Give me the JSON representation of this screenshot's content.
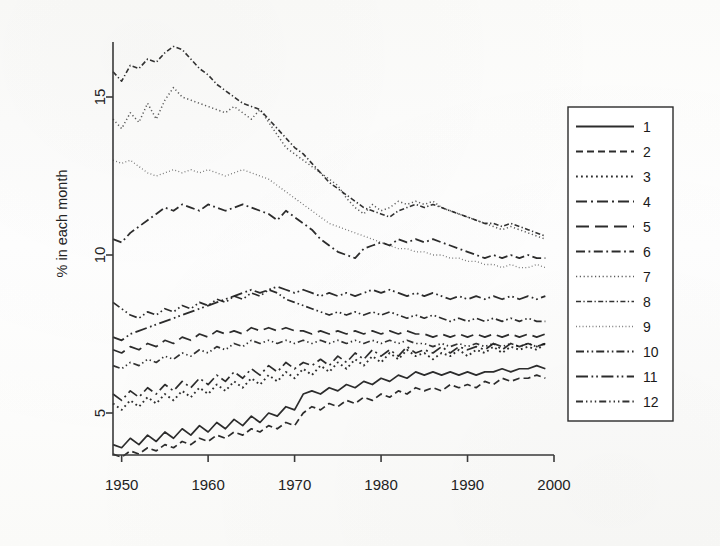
{
  "figure": {
    "title": "",
    "background_color": "#fefefd",
    "ink_color": "#1c1c1c"
  },
  "axes": {
    "ylabel": "% in each month",
    "xlabel": "",
    "y_ticks": [
      "5",
      "10",
      "15"
    ],
    "x_ticks": [
      "1950",
      "1960",
      "1970",
      "1980",
      "1990",
      "2000"
    ]
  },
  "legend": {
    "position": "right",
    "entries": [
      {
        "label": "1",
        "style": "solid"
      },
      {
        "label": "2",
        "style": "dashed"
      },
      {
        "label": "3",
        "style": "dotted"
      },
      {
        "label": "4",
        "style": "long-dash-dot"
      },
      {
        "label": "5",
        "style": "long-dash"
      },
      {
        "label": "6",
        "style": "dash-dot"
      },
      {
        "label": "7",
        "style": "fine-dotted-light"
      },
      {
        "label": "8",
        "style": "fine-dash-dot"
      },
      {
        "label": "9",
        "style": "very-fine-dotted"
      },
      {
        "label": "10",
        "style": "dash-dot-dot"
      },
      {
        "label": "11",
        "style": "long-dash-dot-dot"
      },
      {
        "label": "12",
        "style": "dash-dot-dot-dot"
      }
    ]
  },
  "chart_data": {
    "type": "line",
    "title": "",
    "xlabel": "",
    "ylabel": "% in each month",
    "xlim": [
      1949,
      2000
    ],
    "ylim": [
      3.2,
      17.0
    ],
    "grid": false,
    "legend_position": "right",
    "x": [
      1949,
      1950,
      1951,
      1952,
      1953,
      1954,
      1955,
      1956,
      1957,
      1958,
      1959,
      1960,
      1961,
      1962,
      1963,
      1964,
      1965,
      1966,
      1967,
      1968,
      1969,
      1970,
      1971,
      1972,
      1973,
      1974,
      1975,
      1976,
      1977,
      1978,
      1979,
      1980,
      1981,
      1982,
      1983,
      1984,
      1985,
      1986,
      1987,
      1988,
      1989,
      1990,
      1991,
      1992,
      1993,
      1994,
      1995,
      1996,
      1997,
      1998,
      1999
    ],
    "series": [
      {
        "name": "1",
        "style": "solid",
        "values": [
          4.0,
          3.9,
          4.2,
          4.0,
          4.3,
          4.1,
          4.4,
          4.2,
          4.5,
          4.3,
          4.6,
          4.4,
          4.7,
          4.5,
          4.8,
          4.6,
          4.9,
          4.7,
          5.0,
          4.9,
          5.2,
          5.1,
          5.6,
          5.7,
          5.6,
          5.8,
          5.7,
          5.9,
          5.8,
          6.0,
          5.9,
          6.1,
          6.0,
          6.2,
          6.1,
          6.3,
          6.2,
          6.3,
          6.2,
          6.3,
          6.2,
          6.3,
          6.2,
          6.3,
          6.3,
          6.4,
          6.3,
          6.4,
          6.4,
          6.5,
          6.4
        ]
      },
      {
        "name": "2",
        "style": "dashed",
        "values": [
          3.7,
          3.6,
          3.8,
          3.7,
          3.9,
          3.8,
          4.0,
          3.9,
          4.1,
          4.0,
          4.2,
          4.1,
          4.3,
          4.2,
          4.4,
          4.3,
          4.5,
          4.4,
          4.6,
          4.5,
          4.7,
          4.6,
          5.0,
          5.2,
          5.1,
          5.3,
          5.2,
          5.4,
          5.3,
          5.5,
          5.4,
          5.6,
          5.5,
          5.7,
          5.6,
          5.8,
          5.7,
          5.8,
          5.7,
          5.9,
          5.8,
          5.9,
          5.8,
          6.0,
          5.9,
          6.1,
          6.0,
          6.1,
          6.1,
          6.2,
          6.1
        ]
      },
      {
        "name": "3",
        "style": "dotted",
        "values": [
          5.3,
          5.1,
          5.4,
          5.2,
          5.5,
          5.3,
          5.6,
          5.4,
          5.7,
          5.5,
          5.8,
          5.6,
          5.9,
          5.7,
          6.0,
          5.8,
          6.1,
          5.9,
          6.2,
          6.0,
          6.3,
          6.1,
          6.4,
          6.2,
          6.5,
          6.3,
          6.6,
          6.4,
          6.7,
          6.5,
          6.8,
          6.6,
          6.9,
          6.7,
          7.0,
          6.8,
          6.9,
          6.7,
          6.9,
          6.8,
          7.0,
          6.8,
          7.0,
          6.9,
          7.1,
          6.9,
          7.1,
          7.0,
          7.1,
          7.0,
          7.2
        ]
      },
      {
        "name": "4",
        "style": "long-dash-dot",
        "values": [
          5.6,
          5.4,
          5.7,
          5.5,
          5.8,
          5.6,
          5.9,
          5.7,
          6.0,
          5.8,
          6.1,
          5.9,
          6.2,
          6.0,
          6.3,
          6.1,
          6.4,
          6.2,
          6.5,
          6.3,
          6.6,
          6.4,
          6.6,
          6.5,
          6.7,
          6.5,
          6.8,
          6.6,
          6.9,
          6.7,
          7.0,
          6.8,
          7.0,
          6.8,
          7.1,
          6.9,
          7.0,
          6.9,
          7.1,
          6.9,
          7.1,
          7.0,
          7.1,
          7.0,
          7.2,
          7.0,
          7.2,
          7.1,
          7.2,
          7.1,
          7.2
        ]
      },
      {
        "name": "5",
        "style": "long-dash",
        "values": [
          7.0,
          6.9,
          7.1,
          7.0,
          7.2,
          7.1,
          7.3,
          7.2,
          7.4,
          7.3,
          7.5,
          7.4,
          7.6,
          7.5,
          7.6,
          7.5,
          7.7,
          7.6,
          7.7,
          7.6,
          7.7,
          7.6,
          7.6,
          7.5,
          7.6,
          7.5,
          7.6,
          7.5,
          7.6,
          7.5,
          7.6,
          7.5,
          7.6,
          7.5,
          7.6,
          7.5,
          7.5,
          7.4,
          7.5,
          7.4,
          7.5,
          7.4,
          7.5,
          7.4,
          7.5,
          7.4,
          7.5,
          7.4,
          7.5,
          7.4,
          7.5
        ]
      },
      {
        "name": "6",
        "style": "dash-dot",
        "values": [
          10.5,
          10.4,
          10.7,
          10.9,
          11.1,
          11.3,
          11.5,
          11.4,
          11.6,
          11.5,
          11.4,
          11.6,
          11.5,
          11.4,
          11.5,
          11.6,
          11.5,
          11.4,
          11.3,
          11.1,
          11.4,
          11.2,
          11.0,
          10.8,
          10.5,
          10.3,
          10.1,
          10.0,
          9.9,
          10.2,
          10.3,
          10.4,
          10.3,
          10.5,
          10.4,
          10.5,
          10.4,
          10.5,
          10.4,
          10.3,
          10.2,
          10.1,
          10.0,
          9.9,
          10.0,
          9.9,
          10.0,
          9.9,
          10.0,
          9.9,
          9.9
        ]
      },
      {
        "name": "7",
        "style": "fine-dotted-light",
        "values": [
          14.3,
          14.0,
          14.5,
          14.2,
          14.8,
          14.3,
          14.9,
          15.3,
          15.0,
          14.9,
          14.8,
          14.7,
          14.6,
          14.5,
          14.7,
          14.5,
          14.3,
          14.6,
          14.2,
          13.8,
          13.4,
          13.2,
          13.0,
          12.8,
          12.6,
          12.4,
          12.2,
          11.8,
          11.5,
          11.3,
          11.6,
          11.4,
          11.5,
          11.7,
          11.6,
          11.7,
          11.6,
          11.7,
          11.5,
          11.4,
          11.3,
          11.2,
          11.1,
          11.0,
          10.9,
          10.8,
          10.9,
          10.8,
          10.7,
          10.6,
          10.5
        ]
      },
      {
        "name": "8",
        "style": "fine-dash-dot",
        "values": [
          15.8,
          15.5,
          16.0,
          15.9,
          16.2,
          16.1,
          16.4,
          16.6,
          16.5,
          16.2,
          15.9,
          15.7,
          15.4,
          15.2,
          15.0,
          14.8,
          14.7,
          14.6,
          14.3,
          14.0,
          13.7,
          13.4,
          13.2,
          12.9,
          12.6,
          12.3,
          12.1,
          11.9,
          11.7,
          11.5,
          11.4,
          11.3,
          11.2,
          11.4,
          11.5,
          11.6,
          11.5,
          11.6,
          11.5,
          11.4,
          11.3,
          11.2,
          11.1,
          11.0,
          11.0,
          10.9,
          11.0,
          10.9,
          10.8,
          10.7,
          10.6
        ]
      },
      {
        "name": "9",
        "style": "very-fine-dotted",
        "values": [
          13.0,
          12.9,
          13.0,
          12.8,
          12.6,
          12.5,
          12.6,
          12.7,
          12.6,
          12.7,
          12.6,
          12.7,
          12.6,
          12.5,
          12.6,
          12.7,
          12.6,
          12.5,
          12.4,
          12.2,
          12.0,
          11.8,
          11.6,
          11.4,
          11.2,
          11.0,
          10.9,
          10.8,
          10.7,
          10.6,
          10.5,
          10.4,
          10.3,
          10.2,
          10.2,
          10.1,
          10.1,
          10.0,
          10.0,
          9.9,
          9.9,
          9.8,
          9.8,
          9.7,
          9.7,
          9.6,
          9.7,
          9.6,
          9.6,
          9.7,
          9.6
        ]
      },
      {
        "name": "10",
        "style": "dash-dot-dot",
        "values": [
          8.5,
          8.3,
          8.1,
          8.0,
          8.2,
          8.1,
          8.3,
          8.2,
          8.4,
          8.3,
          8.5,
          8.4,
          8.6,
          8.5,
          8.7,
          8.6,
          8.8,
          8.7,
          8.9,
          8.8,
          8.6,
          8.5,
          8.4,
          8.3,
          8.2,
          8.1,
          8.2,
          8.1,
          8.2,
          8.1,
          8.2,
          8.1,
          8.2,
          8.1,
          8.0,
          8.1,
          8.0,
          8.1,
          8.0,
          7.9,
          8.0,
          7.9,
          8.0,
          7.9,
          8.0,
          7.9,
          8.0,
          7.9,
          8.0,
          7.9,
          7.9
        ]
      },
      {
        "name": "11",
        "style": "long-dash-dot-dot",
        "values": [
          7.4,
          7.3,
          7.5,
          7.6,
          7.7,
          7.8,
          7.9,
          8.0,
          8.1,
          8.2,
          8.3,
          8.4,
          8.5,
          8.6,
          8.7,
          8.8,
          8.9,
          8.8,
          8.9,
          9.0,
          8.9,
          8.8,
          8.9,
          8.8,
          8.7,
          8.8,
          8.7,
          8.8,
          8.7,
          8.8,
          8.9,
          8.8,
          8.9,
          8.8,
          8.7,
          8.8,
          8.7,
          8.8,
          8.7,
          8.6,
          8.7,
          8.6,
          8.7,
          8.6,
          8.7,
          8.6,
          8.7,
          8.6,
          8.7,
          8.6,
          8.7
        ]
      },
      {
        "name": "12",
        "style": "dash-dot-dot-dot",
        "values": [
          6.5,
          6.4,
          6.6,
          6.5,
          6.7,
          6.6,
          6.8,
          6.7,
          6.9,
          6.8,
          7.0,
          6.9,
          7.1,
          7.0,
          7.2,
          7.1,
          7.3,
          7.2,
          7.3,
          7.2,
          7.3,
          7.2,
          7.3,
          7.2,
          7.3,
          7.2,
          7.3,
          7.2,
          7.3,
          7.2,
          7.3,
          7.2,
          7.3,
          7.2,
          7.3,
          7.2,
          7.2,
          7.1,
          7.2,
          7.1,
          7.2,
          7.1,
          7.2,
          7.1,
          7.2,
          7.1,
          7.2,
          7.1,
          7.2,
          7.1,
          7.2
        ]
      }
    ]
  }
}
